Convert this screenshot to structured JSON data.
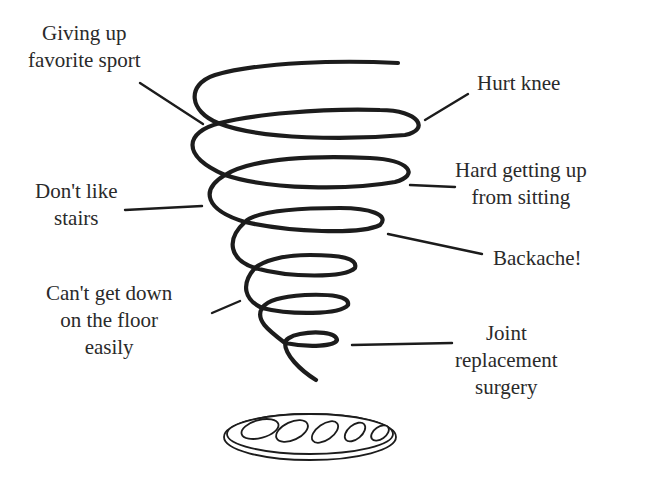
{
  "diagram": {
    "type": "downward-spiral",
    "colors": {
      "ink": "#1c1c1c",
      "text": "#2a2a2a",
      "background": "#ffffff"
    },
    "labels": {
      "giving_up_sport": {
        "line1": "Giving up",
        "line2": "favorite sport"
      },
      "hurt_knee": {
        "line1": "Hurt knee"
      },
      "hard_getting_up": {
        "line1": "Hard getting up",
        "line2": "from sitting"
      },
      "dont_like_stairs": {
        "line1": "Don't like",
        "line2": "stairs"
      },
      "backache": {
        "line1": "Backache!"
      },
      "cant_get_down": {
        "line1": "Can't get down",
        "line2": "on the floor",
        "line3": "easily"
      },
      "joint_replacement": {
        "line1": "Joint",
        "line2": "replacement",
        "line3": "surgery"
      }
    },
    "drain_icon": "drain-grate-icon"
  }
}
